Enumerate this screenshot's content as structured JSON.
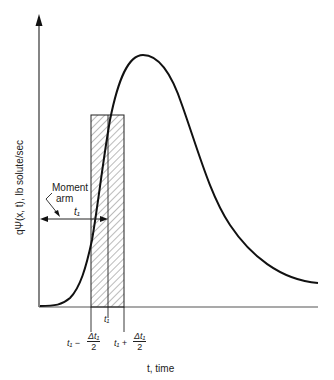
{
  "diagram": {
    "y_axis_label": "qΨ(x, t), lb solute/sec",
    "x_axis_label": "t, time",
    "annotations": {
      "moment_arm_line1": "Moment",
      "moment_arm_line2": "arm",
      "arm_length_label": "t₁",
      "center_tick_label": "t₁",
      "left_edge_prefix": "t₁ −",
      "right_edge_prefix": "t₁ +",
      "frac_numerator": "Δt₁",
      "frac_denominator": "2"
    },
    "colors": {
      "ink": "#111111",
      "axis": "#333333",
      "hatch": "#555555"
    }
  }
}
